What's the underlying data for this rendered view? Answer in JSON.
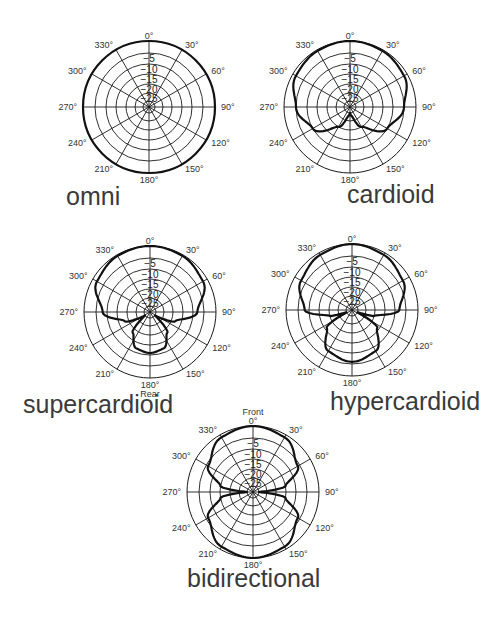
{
  "grid": {
    "angle_labels": [
      "0°",
      "30°",
      "60°",
      "90°",
      "120°",
      "150°",
      "180°",
      "210°",
      "240°",
      "270°",
      "300°",
      "330°"
    ],
    "angles_deg": [
      0,
      30,
      60,
      90,
      120,
      150,
      180,
      210,
      240,
      270,
      300,
      330
    ],
    "db_labels": [
      "−5",
      "−10",
      "−15",
      "−20",
      "−25"
    ],
    "db_levels": [
      0,
      -5,
      -10,
      -15,
      -20,
      -25,
      -30
    ]
  },
  "chart_data": [
    {
      "type": "polar",
      "name": "omni",
      "label": "omni",
      "rlabel": "dB",
      "rlim": [
        -30,
        0
      ],
      "angles": [
        0,
        30,
        60,
        90,
        120,
        150,
        180
      ],
      "db": [
        0,
        0,
        0,
        0,
        0,
        0,
        0
      ],
      "symmetric": true
    },
    {
      "type": "polar",
      "name": "cardioid",
      "label": "cardioid",
      "rlim": [
        -30,
        0
      ],
      "angles": [
        0,
        30,
        60,
        90,
        120,
        150,
        170,
        180
      ],
      "db": [
        0,
        -0.5,
        -1.5,
        -5,
        -10,
        -20,
        -28,
        -30
      ],
      "symmetric": true
    },
    {
      "type": "polar",
      "name": "supercardioid",
      "label": "supercardioid",
      "rear_label": "Rear",
      "rlim": [
        -30,
        0
      ],
      "angles": [
        0,
        30,
        60,
        90,
        110,
        125,
        140,
        160,
        180
      ],
      "db": [
        0,
        -0.5,
        -2,
        -8,
        -18,
        -30,
        -18,
        -12,
        -11
      ],
      "symmetric": true
    },
    {
      "type": "polar",
      "name": "hypercardioid",
      "label": "hypercardioid",
      "rlim": [
        -30,
        0
      ],
      "angles": [
        0,
        30,
        60,
        90,
        105,
        112,
        125,
        150,
        180
      ],
      "db": [
        0,
        -1,
        -3,
        -8,
        -20,
        -30,
        -16,
        -8,
        -6
      ],
      "symmetric": true
    },
    {
      "type": "polar",
      "name": "bidirectional",
      "label": "bidirectional",
      "front_label": "Front",
      "rlim": [
        -30,
        0
      ],
      "angles": [
        0,
        30,
        60,
        80,
        90,
        100,
        120,
        150,
        180
      ],
      "db": [
        0,
        -1.2,
        -6,
        -15,
        -30,
        -15,
        -6,
        -1.2,
        0
      ],
      "symmetric": true
    }
  ]
}
